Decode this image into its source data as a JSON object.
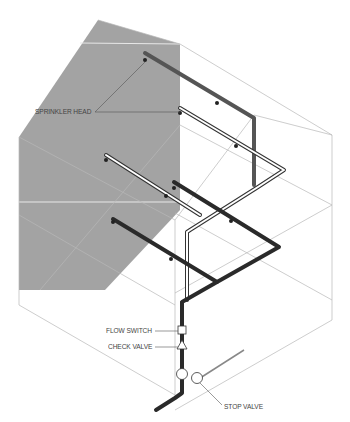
{
  "diagram": {
    "title": "",
    "colors": {
      "wall_shade": "#a3a3a3",
      "outline": "#b8b8b8",
      "pipe_dark": "#2a2a2a",
      "pipe_light_outline": "#333333",
      "label_text": "#444444",
      "leader_line": "#555555"
    },
    "labels": {
      "sprinkler_head": "SPRINKLER HEAD",
      "flow_switch": "FLOW SWITCH",
      "check_valve": "CHECK VALVE",
      "stop_valve": "STOP VALVE"
    },
    "components": [
      {
        "id": "sprinkler-head",
        "symbol": "small dot on pipe branch"
      },
      {
        "id": "flow-switch",
        "symbol": "square"
      },
      {
        "id": "check-valve",
        "symbol": "triangle"
      },
      {
        "id": "stop-valve",
        "symbol": "circle"
      }
    ]
  }
}
